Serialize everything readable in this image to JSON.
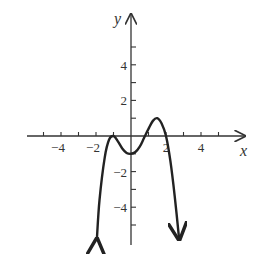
{
  "chart_data": {
    "type": "line",
    "title": "",
    "xlabel": "x",
    "ylabel": "y",
    "xlim": [
      -5.5,
      6
    ],
    "ylim": [
      -6,
      6.5
    ],
    "grid": false,
    "legend": null,
    "x_tick_labels": [
      "-4",
      "-2",
      "2",
      "4"
    ],
    "y_tick_labels": [
      "4",
      "2",
      "-2",
      "-4"
    ],
    "x_ticks": [
      -5,
      -4,
      -3,
      -2,
      -1,
      1,
      2,
      3,
      4,
      5
    ],
    "y_ticks": [
      -5,
      -4,
      -3,
      -2,
      -1,
      1,
      2,
      3,
      4,
      5
    ],
    "series": [
      {
        "name": "f(x)",
        "x": [
          -1.95,
          -1.8,
          -1.5,
          -1.25,
          -1.0,
          -0.75,
          -0.5,
          -0.25,
          0.0,
          0.25,
          0.5,
          0.75,
          1.0,
          1.25,
          1.5,
          1.75,
          2.0,
          2.25,
          2.5,
          2.75
        ],
        "y": [
          -5.8,
          -3.6,
          -1.2,
          -0.2,
          0.0,
          -0.3,
          -0.7,
          -0.95,
          -1.0,
          -0.9,
          -0.6,
          -0.1,
          0.4,
          0.85,
          1.0,
          0.7,
          0.0,
          -1.4,
          -3.4,
          -5.8
        ],
        "end_arrows": true
      }
    ],
    "annotations": [
      "both ends of curve have downward arrows"
    ]
  },
  "axes": {
    "x_label": "x",
    "y_label": "y",
    "x_tick_labels": [
      {
        "text": "−4",
        "value": -4
      },
      {
        "text": "−2",
        "value": -2
      },
      {
        "text": "2",
        "value": 2
      },
      {
        "text": "4",
        "value": 4
      }
    ],
    "y_tick_labels": [
      {
        "text": "4",
        "value": 4
      },
      {
        "text": "2",
        "value": 2
      },
      {
        "text": "−2",
        "value": -2
      },
      {
        "text": "−4",
        "value": -4
      }
    ]
  },
  "colors": {
    "axis": "#333333",
    "curve": "#222222",
    "background": "#ffffff"
  }
}
